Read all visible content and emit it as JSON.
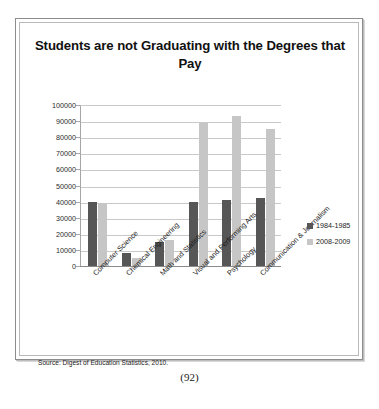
{
  "page_number": "(92)",
  "source_note": "Source: Digest of Education Statistics, 2010.",
  "chart_data": {
    "type": "bar",
    "title": "Students are not Graduating with the Degrees that Pay",
    "xlabel": "",
    "ylabel": "",
    "ylim": [
      0,
      100000
    ],
    "yticks": [
      0,
      10000,
      20000,
      30000,
      40000,
      50000,
      60000,
      70000,
      80000,
      90000,
      100000
    ],
    "grid": true,
    "legend_position": "right",
    "categories": [
      "Computer Science",
      "Chemical Engineering",
      "Math and Statistics",
      "Visual and Performing Arts",
      "Psychology",
      "Communication & Journalism"
    ],
    "series": [
      {
        "name": "1984-1985",
        "color": "#565656",
        "values": [
          40000,
          8000,
          15000,
          40000,
          41000,
          42000
        ]
      },
      {
        "name": "2008-2009",
        "color": "#c6c6c6",
        "values": [
          39000,
          5000,
          16000,
          89000,
          93000,
          85000
        ]
      }
    ]
  }
}
